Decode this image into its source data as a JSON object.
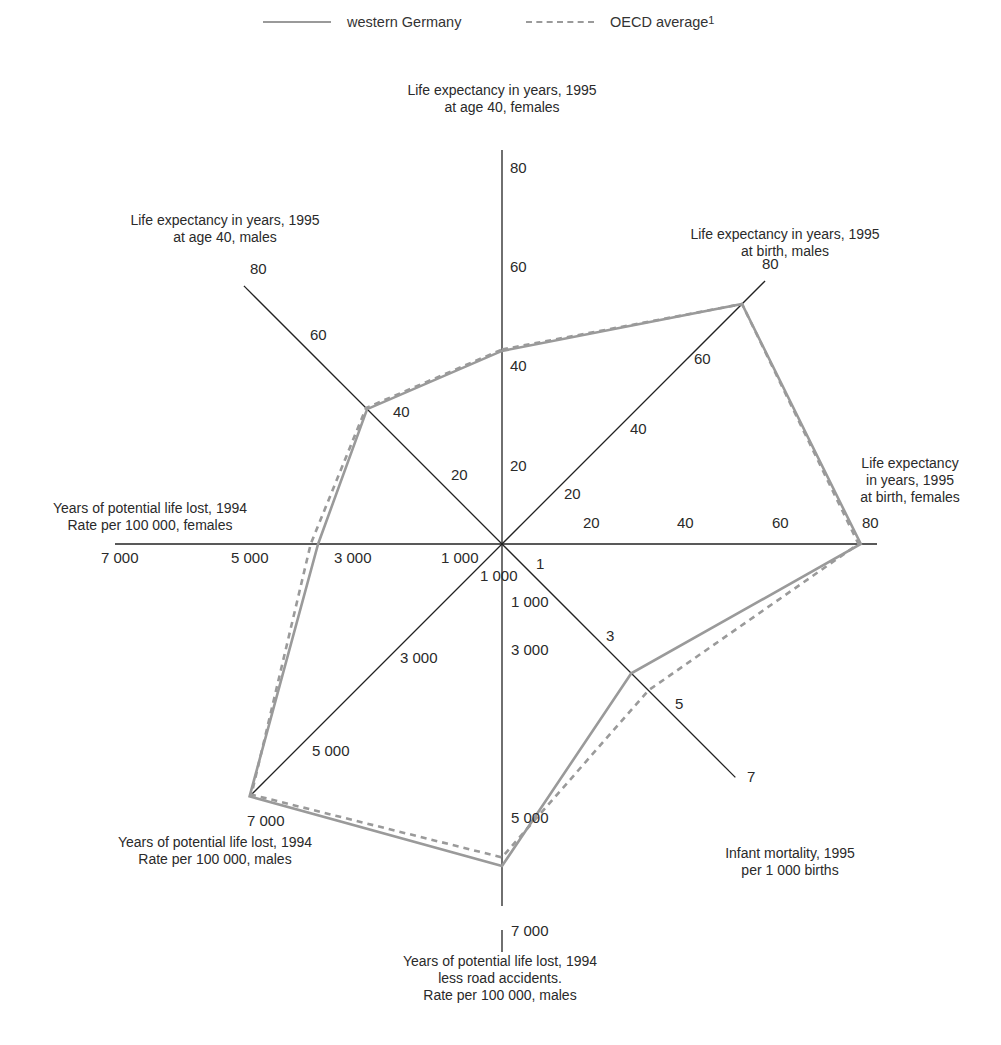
{
  "title": "",
  "legend": [
    {
      "label": "western Germany",
      "style": "solid",
      "color": "#9a9a9a"
    },
    {
      "label": "OECD average",
      "footnote": "1",
      "style": "dashed",
      "color": "#9a9a9a"
    }
  ],
  "axes": [
    {
      "id": "le40f",
      "label_lines": [
        "Life expectancy in years, 1995",
        "at age 40, females"
      ],
      "ticks": [
        "20",
        "40",
        "60",
        "80"
      ]
    },
    {
      "id": "lebm",
      "label_lines": [
        "Life expectancy in years, 1995",
        "at birth, males"
      ],
      "ticks": [
        "20",
        "40",
        "60",
        "80"
      ]
    },
    {
      "id": "lebf",
      "label_lines": [
        "Life expectancy",
        "in years, 1995",
        "at birth, females"
      ],
      "ticks": [
        "20",
        "40",
        "60",
        "80"
      ]
    },
    {
      "id": "im",
      "label_lines": [
        "Infant mortality, 1995",
        "per 1 000 births"
      ],
      "ticks": [
        "1",
        "3",
        "5",
        "7"
      ]
    },
    {
      "id": "ypllra",
      "label_lines": [
        "Years of potential life lost, 1994",
        "less road accidents.",
        "Rate per 100 000, males"
      ],
      "ticks": [
        "1 000",
        "3 000",
        "5 000",
        "7 000"
      ]
    },
    {
      "id": "ypllm",
      "label_lines": [
        "Years of potential life lost, 1994",
        "Rate per 100 000, males"
      ],
      "ticks": [
        "1 000",
        "3 000",
        "5 000",
        "7 000"
      ]
    },
    {
      "id": "ypllf",
      "label_lines": [
        "Years of potential life lost, 1994",
        "Rate per 100 000, females"
      ],
      "ticks": [
        "1 000",
        "3 000",
        "5 000",
        "7 000"
      ]
    },
    {
      "id": "le40m",
      "label_lines": [
        "Life expectancy in years, 1995",
        "at age 40, males"
      ],
      "ticks": [
        "20",
        "40",
        "60",
        "80"
      ]
    }
  ],
  "chart_data": {
    "type": "radar",
    "title": "",
    "legend_position": "top",
    "grid": false,
    "categories": [
      "Life expectancy in years, 1995 at age 40, females",
      "Life expectancy in years, 1995 at birth, males",
      "Life expectancy in years, 1995 at birth, females",
      "Infant mortality, 1995 per 1 000 births",
      "Years of potential life lost, 1994 less road accidents. Rate per 100 000, males",
      "Years of potential life lost, 1994 Rate per 100 000, males",
      "Years of potential life lost, 1994 Rate per 100 000, females",
      "Life expectancy in years, 1995 at age 40, males"
    ],
    "axis_ranges": [
      [
        0,
        80
      ],
      [
        0,
        80
      ],
      [
        0,
        80
      ],
      [
        0,
        8
      ],
      [
        0,
        7500
      ],
      [
        0,
        7500
      ],
      [
        0,
        7500
      ],
      [
        0,
        80
      ]
    ],
    "series": [
      {
        "name": "western Germany",
        "style": "solid",
        "values": [
          39,
          73,
          78,
          5.3,
          5600,
          6800,
          3700,
          35
        ]
      },
      {
        "name": "OECD average",
        "style": "dashed",
        "values": [
          39.3,
          73,
          77.5,
          6.0,
          5450,
          6750,
          3850,
          35.3
        ]
      }
    ]
  }
}
